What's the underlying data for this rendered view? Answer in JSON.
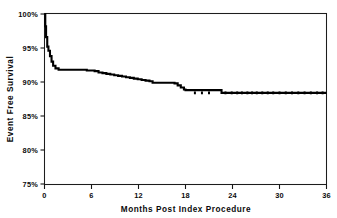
{
  "chart_data": {
    "type": "line",
    "title": "",
    "subtitle": "",
    "xlabel": "Months Post Index Procedure",
    "ylabel": "Event Free Survival",
    "xlim": [
      0,
      36
    ],
    "ylim": [
      75,
      100
    ],
    "grid": false,
    "legend": null,
    "legend_position": "none",
    "x_ticks": [
      0,
      6,
      12,
      18,
      24,
      30,
      36
    ],
    "x_tick_labels": [
      "0",
      "6",
      "12",
      "18",
      "24",
      "30",
      "36"
    ],
    "y_ticks": [
      75,
      80,
      85,
      90,
      95,
      100
    ],
    "y_tick_labels": [
      "75%",
      "80%",
      "85%",
      "90%",
      "95%",
      "100%"
    ],
    "annotations": [],
    "series": [
      {
        "name": "Event Free Survival",
        "style": "kaplan-meier-step",
        "color": "#000000",
        "x": [
          0.0,
          0.1,
          0.2,
          0.35,
          0.5,
          0.7,
          0.9,
          1.1,
          1.4,
          1.8,
          2.4,
          3.0,
          3.6,
          4.2,
          4.8,
          5.4,
          6.0,
          6.4,
          6.9,
          7.4,
          7.9,
          8.4,
          8.9,
          9.4,
          9.9,
          10.4,
          10.9,
          11.4,
          11.9,
          12.4,
          12.9,
          13.4,
          13.8,
          14.2,
          14.8,
          15.4,
          16.0,
          16.6,
          17.0,
          17.4,
          17.8,
          18.0,
          18.4,
          19.0,
          20.0,
          21.0,
          22.0,
          22.4,
          22.6,
          24.0,
          26.0,
          28.0,
          30.0,
          32.0,
          34.0,
          36.0
        ],
        "y": [
          100.0,
          98.2,
          96.6,
          95.2,
          94.6,
          93.8,
          93.0,
          92.4,
          92.0,
          91.8,
          91.8,
          91.8,
          91.8,
          91.8,
          91.8,
          91.7,
          91.7,
          91.6,
          91.4,
          91.3,
          91.2,
          91.1,
          91.0,
          90.9,
          90.8,
          90.7,
          90.6,
          90.5,
          90.4,
          90.3,
          90.2,
          90.1,
          89.9,
          89.9,
          89.9,
          89.9,
          89.9,
          89.8,
          89.5,
          89.2,
          88.9,
          88.8,
          88.8,
          88.8,
          88.8,
          88.8,
          88.8,
          88.8,
          88.4,
          88.4,
          88.4,
          88.4,
          88.4,
          88.4,
          88.4,
          88.4
        ]
      }
    ],
    "censor_times": [
      19.2,
      20.1,
      21.0,
      23.1,
      23.9,
      24.6,
      25.2,
      25.9,
      26.5,
      27.1,
      27.8,
      28.5,
      29.2,
      30.0,
      30.8,
      31.6,
      32.4,
      33.2,
      34.0,
      34.8,
      35.5
    ],
    "censor_value": 88.4
  }
}
